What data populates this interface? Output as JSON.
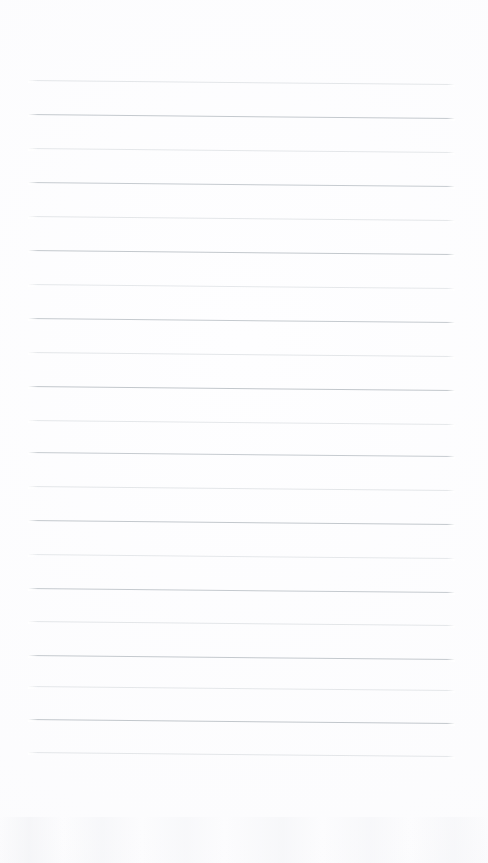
{
  "page": {
    "kind": "blank-ruled-notebook-page",
    "width": 488,
    "height": 863,
    "background_color": "#fefeff",
    "paper_tint_color": "#f6f7f9",
    "text_content": "",
    "visible_text": []
  },
  "ruling": {
    "line_count": 21,
    "line_spacing_px": 34,
    "first_line_y": 80,
    "last_line_y": 752,
    "left_margin_px": 28,
    "right_margin_px": 33,
    "line_length_px": 427,
    "tilt_degrees": 0.55,
    "thickness_px": 1,
    "dark_line_color": "#c2c7cc",
    "light_line_color": "#dde1e4",
    "pattern": "alternating-dark-light",
    "lines": [
      {
        "index": 1,
        "y": 80,
        "tone": "light",
        "color": "#dfe2e5",
        "opacity": 0.85
      },
      {
        "index": 2,
        "y": 114,
        "tone": "dark",
        "color": "#c4c9ce",
        "opacity": 1.0
      },
      {
        "index": 3,
        "y": 148,
        "tone": "light",
        "color": "#e0e3e6",
        "opacity": 0.85
      },
      {
        "index": 4,
        "y": 182,
        "tone": "dark",
        "color": "#c6cbd0",
        "opacity": 1.0
      },
      {
        "index": 5,
        "y": 216,
        "tone": "light",
        "color": "#dfe2e5",
        "opacity": 0.85
      },
      {
        "index": 6,
        "y": 250,
        "tone": "dark",
        "color": "#c3c8cd",
        "opacity": 1.0
      },
      {
        "index": 7,
        "y": 284,
        "tone": "light",
        "color": "#e1e4e7",
        "opacity": 0.85
      },
      {
        "index": 8,
        "y": 318,
        "tone": "dark",
        "color": "#c5cacf",
        "opacity": 1.0
      },
      {
        "index": 9,
        "y": 352,
        "tone": "light",
        "color": "#dfe2e5",
        "opacity": 0.85
      },
      {
        "index": 10,
        "y": 386,
        "tone": "dark",
        "color": "#c2c7cc",
        "opacity": 1.0
      },
      {
        "index": 11,
        "y": 420,
        "tone": "light",
        "color": "#e0e3e6",
        "opacity": 0.85
      },
      {
        "index": 12,
        "y": 452,
        "tone": "dark",
        "color": "#c6cbd0",
        "opacity": 1.0
      },
      {
        "index": 13,
        "y": 486,
        "tone": "light",
        "color": "#dfe2e5",
        "opacity": 0.85
      },
      {
        "index": 14,
        "y": 520,
        "tone": "dark",
        "color": "#c3c8cd",
        "opacity": 1.0
      },
      {
        "index": 15,
        "y": 554,
        "tone": "light",
        "color": "#e1e4e7",
        "opacity": 0.85
      },
      {
        "index": 16,
        "y": 588,
        "tone": "dark",
        "color": "#c5cacf",
        "opacity": 1.0
      },
      {
        "index": 17,
        "y": 621,
        "tone": "light",
        "color": "#dfe2e5",
        "opacity": 0.85
      },
      {
        "index": 18,
        "y": 655,
        "tone": "dark",
        "color": "#c4c9ce",
        "opacity": 1.0
      },
      {
        "index": 19,
        "y": 686,
        "tone": "light",
        "color": "#e0e3e6",
        "opacity": 0.85
      },
      {
        "index": 20,
        "y": 719,
        "tone": "dark",
        "color": "#c2c7cc",
        "opacity": 1.0
      },
      {
        "index": 21,
        "y": 752,
        "tone": "light",
        "color": "#dfe2e5",
        "opacity": 0.85
      }
    ]
  }
}
